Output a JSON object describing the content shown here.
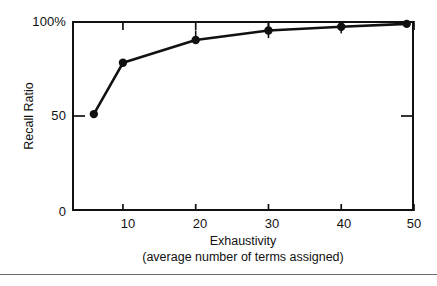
{
  "chart_data": {
    "type": "line",
    "title": "",
    "xlabel": "Exhaustivity",
    "xlabel_sub": "(average number of terms assigned)",
    "ylabel": "Recall Ratio",
    "xlim": [
      3,
      50
    ],
    "ylim": [
      0,
      100
    ],
    "grid": false,
    "legend": "none",
    "x_ticks": [
      10,
      20,
      30,
      40,
      50
    ],
    "x_tick_labels": [
      "10",
      "20",
      "30",
      "40",
      "50"
    ],
    "y_ticks": [
      0,
      50,
      100
    ],
    "y_tick_labels": [
      "0",
      "50",
      "100%"
    ],
    "series": [
      {
        "name": "Recall Ratio",
        "marker": "filled-circle",
        "x": [
          6,
          10,
          20,
          30,
          40,
          49
        ],
        "values": [
          51,
          78,
          90,
          95,
          97,
          98.5
        ],
        "error_up": [
          0,
          0,
          5,
          4,
          3.5,
          1.5
        ],
        "error_down": [
          0,
          0,
          0,
          4,
          3.5,
          0
        ]
      }
    ]
  },
  "axis": {
    "y_label": "Recall Ratio",
    "x_label_line1": "Exhaustivity",
    "x_label_line2": "(average number of terms assigned)",
    "y_tick_0": "0",
    "y_tick_50": "50",
    "y_tick_100": "100%",
    "x_tick_10": "10",
    "x_tick_20": "20",
    "x_tick_30": "30",
    "x_tick_40": "40",
    "x_tick_50": "50"
  },
  "style": {
    "ink": "#111111",
    "background": "#ffffff",
    "rule": "#6b6b6b"
  }
}
